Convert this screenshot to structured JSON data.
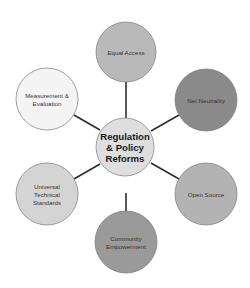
{
  "diagram": {
    "type": "hub-and-spoke",
    "center": {
      "label_lines": [
        "Regulation",
        "& Policy",
        "Reforms"
      ],
      "fill": "#dedede",
      "cx": 125,
      "cy": 147,
      "r": 29
    },
    "nodes": [
      {
        "id": "equal-access",
        "label_lines": [
          "Equal Access"
        ],
        "fill": "#b9b9b9",
        "cx": 126,
        "cy": 52,
        "r": 30
      },
      {
        "id": "net-neutrality",
        "label_lines": [
          "Net Neutrality"
        ],
        "fill": "#8a8a8a",
        "cx": 206,
        "cy": 100,
        "r": 31
      },
      {
        "id": "open-source",
        "label_lines": [
          "Open Source"
        ],
        "fill": "#b3b3b3",
        "cx": 206,
        "cy": 194,
        "r": 31
      },
      {
        "id": "community-empowerment",
        "label_lines": [
          "Community",
          "Empowerment"
        ],
        "fill": "#9a9a9a",
        "cx": 126,
        "cy": 242,
        "r": 31
      },
      {
        "id": "universal-technical-standards",
        "label_lines": [
          "Universal",
          "Technical",
          "Standards"
        ],
        "fill": "#d4d4d4",
        "cx": 47,
        "cy": 194,
        "r": 31
      },
      {
        "id": "measurement-evaluation",
        "label_lines": [
          "Measurement &",
          "Evaluation"
        ],
        "fill": "#f4f4f4",
        "cx": 47,
        "cy": 99,
        "r": 31
      }
    ],
    "connectors": [
      {
        "to": "equal-access",
        "x1": 126,
        "y1": 82,
        "x2": 126,
        "y2": 118
      },
      {
        "to": "net-neutrality",
        "x1": 179,
        "y1": 115,
        "x2": 151,
        "y2": 131
      },
      {
        "to": "open-source",
        "x1": 179,
        "y1": 179,
        "x2": 151,
        "y2": 163
      },
      {
        "to": "community-empowerment",
        "x1": 126,
        "y1": 193,
        "x2": 126,
        "y2": 211
      },
      {
        "to": "universal-technical-standards",
        "x1": 74,
        "y1": 179,
        "x2": 100,
        "y2": 164
      },
      {
        "to": "measurement-evaluation",
        "x1": 74,
        "y1": 115,
        "x2": 100,
        "y2": 130
      }
    ]
  }
}
